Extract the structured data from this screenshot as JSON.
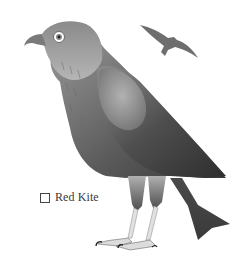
{
  "species": {
    "name": "Red Kite",
    "checked": false
  },
  "illustration": {
    "subject": "perched-red-kite",
    "secondary": "red-kite-in-flight",
    "palette": {
      "dark": "#3a3a3a",
      "mid": "#7a7a7a",
      "light": "#c8c8c8",
      "pale": "#e6e6e6",
      "background": "#ffffff"
    }
  }
}
